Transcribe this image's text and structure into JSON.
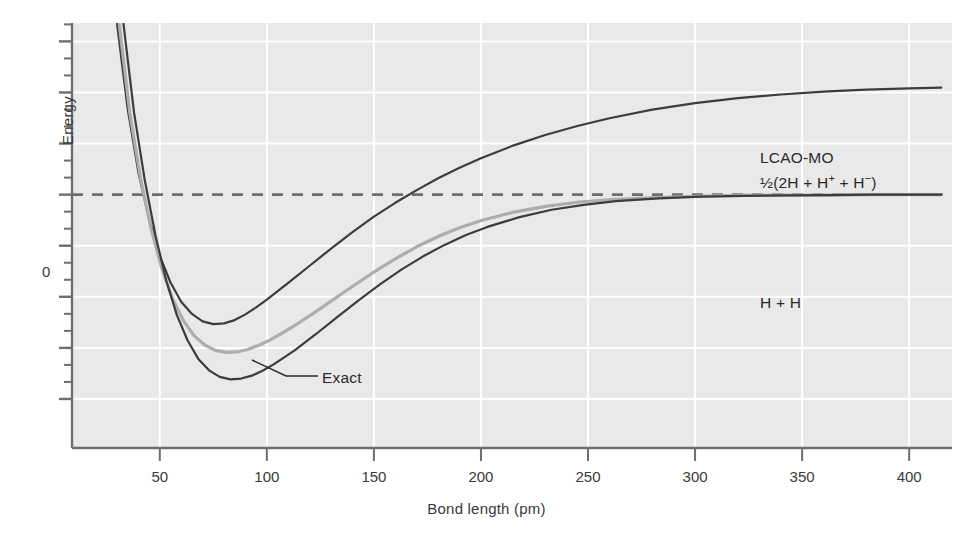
{
  "chart_data": {
    "type": "line",
    "title": "",
    "xlabel": "Bond length (pm)",
    "ylabel": "Energy",
    "xlim": [
      9,
      420
    ],
    "ylim": [
      -0.62,
      0.42
    ],
    "xticks": [
      50,
      100,
      150,
      200,
      250,
      300,
      350,
      400
    ],
    "xticklabels": [
      "50",
      "100",
      "150",
      "200",
      "250",
      "300",
      "350",
      "400"
    ],
    "yticks": [
      0
    ],
    "yticklabels": [
      "0"
    ],
    "grid": true,
    "grid_color": "#ffffff",
    "background": "#e9e9e9",
    "zero_line": {
      "value": 0,
      "style": "dashed",
      "color": "#6e6e6e"
    },
    "legend": "none",
    "annotations": [
      {
        "name": "lcao-mo",
        "text": "LCAO-MO",
        "x": 318,
        "y": 0.255
      },
      {
        "name": "lcao-mo-fragments",
        "text": "½(2H + H⁺ + H⁻)",
        "x": 318,
        "y": 0.198
      },
      {
        "name": "h-plus-h",
        "text": "H + H",
        "x": 318,
        "y": -0.06
      },
      {
        "name": "exact",
        "text": "Exact",
        "x": 127,
        "y": -0.255,
        "leader_line": true
      }
    ],
    "series": [
      {
        "name": "LCAO-MO upper",
        "color": "#3c3c3c",
        "width": 2.2,
        "points": [
          [
            30,
            0.42
          ],
          [
            35,
            0.21
          ],
          [
            40,
            0.055
          ],
          [
            45,
            -0.06
          ],
          [
            50,
            -0.15
          ],
          [
            55,
            -0.215
          ],
          [
            60,
            -0.262
          ],
          [
            65,
            -0.292
          ],
          [
            70,
            -0.31
          ],
          [
            75,
            -0.317
          ],
          [
            80,
            -0.315
          ],
          [
            85,
            -0.307
          ],
          [
            90,
            -0.293
          ],
          [
            95,
            -0.276
          ],
          [
            100,
            -0.257
          ],
          [
            110,
            -0.216
          ],
          [
            120,
            -0.174
          ],
          [
            130,
            -0.132
          ],
          [
            140,
            -0.092
          ],
          [
            150,
            -0.054
          ],
          [
            160,
            -0.02
          ],
          [
            170,
            0.011
          ],
          [
            180,
            0.04
          ],
          [
            190,
            0.066
          ],
          [
            200,
            0.089
          ],
          [
            215,
            0.12
          ],
          [
            230,
            0.146
          ],
          [
            245,
            0.168
          ],
          [
            260,
            0.187
          ],
          [
            280,
            0.208
          ],
          [
            300,
            0.224
          ],
          [
            320,
            0.236
          ],
          [
            340,
            0.245
          ],
          [
            360,
            0.252
          ],
          [
            380,
            0.257
          ],
          [
            400,
            0.26
          ],
          [
            415,
            0.262
          ]
        ]
      },
      {
        "name": "Exact",
        "color": "#adadad",
        "width": 3.2,
        "points": [
          [
            31,
            0.42
          ],
          [
            36,
            0.2
          ],
          [
            41,
            0.04
          ],
          [
            46,
            -0.085
          ],
          [
            51,
            -0.182
          ],
          [
            56,
            -0.255
          ],
          [
            61,
            -0.308
          ],
          [
            66,
            -0.345
          ],
          [
            71,
            -0.368
          ],
          [
            76,
            -0.381
          ],
          [
            81,
            -0.386
          ],
          [
            86,
            -0.385
          ],
          [
            91,
            -0.379
          ],
          [
            96,
            -0.369
          ],
          [
            101,
            -0.357
          ],
          [
            111,
            -0.327
          ],
          [
            121,
            -0.293
          ],
          [
            131,
            -0.257
          ],
          [
            141,
            -0.221
          ],
          [
            151,
            -0.186
          ],
          [
            161,
            -0.154
          ],
          [
            171,
            -0.125
          ],
          [
            181,
            -0.1
          ],
          [
            191,
            -0.079
          ],
          [
            201,
            -0.062
          ],
          [
            216,
            -0.042
          ],
          [
            231,
            -0.028
          ],
          [
            246,
            -0.018
          ],
          [
            261,
            -0.012
          ],
          [
            281,
            -0.007
          ],
          [
            301,
            -0.004
          ],
          [
            321,
            -0.002
          ],
          [
            341,
            -0.001
          ],
          [
            361,
            -0.001
          ],
          [
            381,
            0.0
          ],
          [
            401,
            0.0
          ],
          [
            415,
            0.0
          ]
        ]
      },
      {
        "name": "Exact deep",
        "color": "#3c3c3c",
        "width": 2.2,
        "points": [
          [
            33,
            0.42
          ],
          [
            38,
            0.2
          ],
          [
            43,
            0.035
          ],
          [
            48,
            -0.1
          ],
          [
            53,
            -0.21
          ],
          [
            58,
            -0.295
          ],
          [
            63,
            -0.357
          ],
          [
            68,
            -0.402
          ],
          [
            73,
            -0.43
          ],
          [
            78,
            -0.446
          ],
          [
            83,
            -0.452
          ],
          [
            88,
            -0.45
          ],
          [
            93,
            -0.443
          ],
          [
            98,
            -0.431
          ],
          [
            103,
            -0.416
          ],
          [
            113,
            -0.381
          ],
          [
            123,
            -0.341
          ],
          [
            133,
            -0.299
          ],
          [
            143,
            -0.258
          ],
          [
            153,
            -0.219
          ],
          [
            163,
            -0.183
          ],
          [
            173,
            -0.151
          ],
          [
            183,
            -0.123
          ],
          [
            193,
            -0.099
          ],
          [
            203,
            -0.079
          ],
          [
            218,
            -0.055
          ],
          [
            233,
            -0.037
          ],
          [
            248,
            -0.025
          ],
          [
            263,
            -0.016
          ],
          [
            283,
            -0.009
          ],
          [
            303,
            -0.005
          ],
          [
            323,
            -0.003
          ],
          [
            343,
            -0.002
          ],
          [
            363,
            -0.001
          ],
          [
            383,
            0.0
          ],
          [
            403,
            0.0
          ],
          [
            415,
            0.0
          ]
        ]
      }
    ]
  },
  "axes": {
    "energy_label": "Energy",
    "bond_length_label": "Bond length (pm)",
    "zero_label": "0"
  },
  "annotations": {
    "lcao_mo": "LCAO-MO",
    "lcao_mo_fragments_prefix": "½(2H + H",
    "lcao_mo_fragments_sup1": "+",
    "lcao_mo_fragments_mid": " + H",
    "lcao_mo_fragments_sup2": "−",
    "lcao_mo_fragments_suffix": ")",
    "h_plus_h": "H + H",
    "exact": "Exact"
  },
  "colors": {
    "plot_background": "#e9e9e9",
    "grid": "#ffffff",
    "axis": "#6e6e6e",
    "curve_dark": "#3c3c3c",
    "curve_gray": "#adadad",
    "text": "#3a3a3a"
  }
}
